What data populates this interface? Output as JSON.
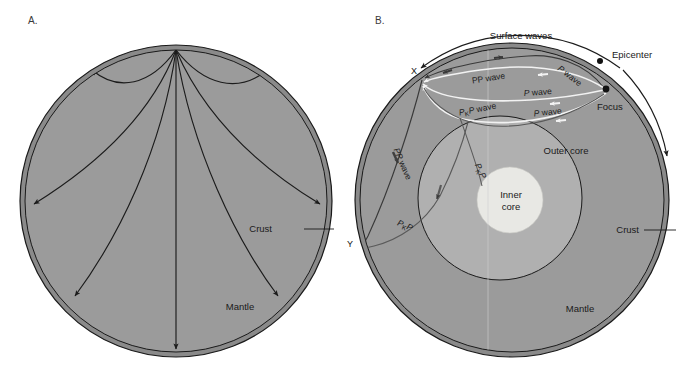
{
  "figure": {
    "panels": [
      {
        "id": "A",
        "letter": "A.",
        "labels": {
          "crust": "Crust",
          "mantle": "Mantle"
        }
      },
      {
        "id": "B",
        "letter": "B.",
        "labels": {
          "surface_waves": "Surface waves",
          "epicenter": "Epicenter",
          "focus": "Focus",
          "outer_core": "Outer core",
          "inner_core_line1": "Inner",
          "inner_core_line2": "core",
          "crust": "Crust",
          "mantle": "Mantle",
          "station_x": "X",
          "station_y": "Y"
        },
        "wave_labels": [
          {
            "name": "pp-wave-upper",
            "text": "PP wave"
          },
          {
            "name": "p-wave-upper-right",
            "text": "P wave"
          },
          {
            "name": "p-wave-middle",
            "text": "P wave"
          },
          {
            "name": "pkp-wave",
            "text_p1": "P",
            "text_sub": "K",
            "text_p2": "P wave"
          },
          {
            "name": "p-wave-lower",
            "text": "P wave"
          },
          {
            "name": "pp-wave-left",
            "text": "PP wave"
          },
          {
            "name": "pkp-left-lower",
            "text_p1": "P",
            "text_sub": "K",
            "text_p2": "P"
          },
          {
            "name": "pkp-core",
            "text_p1": "P",
            "text_sub": "K",
            "text_p2": "P"
          }
        ]
      }
    ]
  },
  "colors": {
    "background": "#ffffff",
    "mantle": "#9b9b9b",
    "outer_core": "#b0b0b0",
    "inner_core": "#e8e8e4",
    "crust": "#8a8a8a",
    "outline": "#1a1a1a",
    "ray_dark": "#2b2b2b",
    "ray_light": "#f2f2f2",
    "text": "#1a1a1a"
  }
}
